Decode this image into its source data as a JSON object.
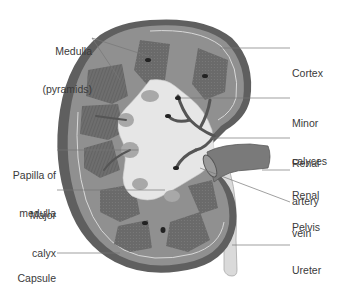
{
  "diagram": {
    "colors": {
      "capsule": "#5e5e5e",
      "cortex": "#8f8f8f",
      "cortex_line": "#d8d8d8",
      "pyramid": "#6a6a6a",
      "sinus": "#e4e4e4",
      "vessel": "#555555",
      "ureter": "#d9d9d9",
      "leader_line": "#777777",
      "label_text": "#3a3a3a"
    },
    "labels_left": [
      {
        "id": "medulla",
        "line1": "Medulla",
        "line2": "(pyramids)"
      },
      {
        "id": "papilla",
        "line1": "Papilla of",
        "line2": "medulla"
      },
      {
        "id": "major-calyx",
        "line1": "Major",
        "line2": "calyx"
      },
      {
        "id": "capsule",
        "line1": "Capsule",
        "line2": ""
      }
    ],
    "labels_right": [
      {
        "id": "cortex",
        "line1": "Cortex",
        "line2": ""
      },
      {
        "id": "minor-calyces",
        "line1": "Minor",
        "line2": "calyces"
      },
      {
        "id": "renal-artery",
        "line1": "Renal",
        "line2": "artery"
      },
      {
        "id": "renal-vein",
        "line1": "Renal",
        "line2": "vein"
      },
      {
        "id": "pelvis",
        "line1": "Pelvis",
        "line2": ""
      },
      {
        "id": "ureter",
        "line1": "Ureter",
        "line2": ""
      }
    ]
  }
}
